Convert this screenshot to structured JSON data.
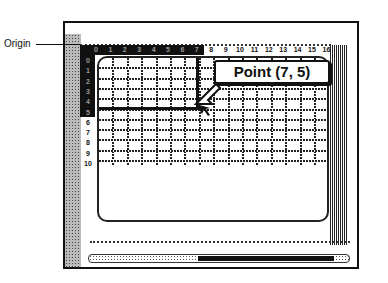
{
  "annotation": {
    "origin_label": "Origin",
    "callout_text": "Point (7, 5)"
  },
  "grid": {
    "x_ticks": [
      "0",
      "1",
      "2",
      "3",
      "4",
      "5",
      "6",
      "7",
      "8",
      "9",
      "10",
      "11",
      "12",
      "13",
      "14",
      "15",
      "16"
    ],
    "y_ticks": [
      "0",
      "1",
      "2",
      "3",
      "4",
      "5",
      "6",
      "7",
      "8",
      "9",
      "10"
    ],
    "highlighted_point": {
      "x": 7,
      "y": 5
    },
    "highlight_x_range": [
      0,
      7
    ],
    "highlight_y_range": [
      0,
      5
    ]
  },
  "colors": {
    "ink": "#111111",
    "background": "#ffffff",
    "muted_tick": "#999999"
  }
}
